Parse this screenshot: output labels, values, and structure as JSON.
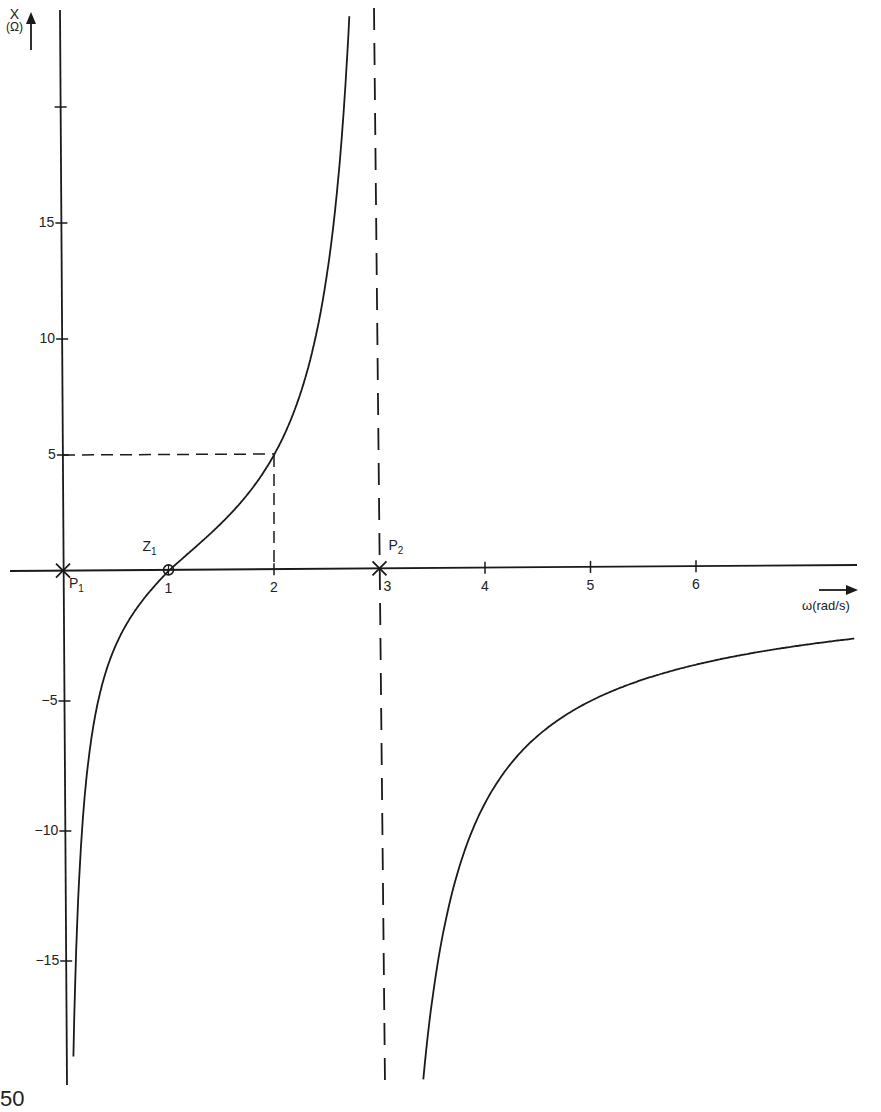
{
  "chart_data": {
    "type": "line",
    "title": "",
    "xlabel": "ω(rad/s)",
    "ylabel": "X",
    "ylabel_unit": "(Ω)",
    "x_ticks": [
      1,
      2,
      3,
      4,
      5,
      6
    ],
    "y_ticks": [
      -15,
      -10,
      -5,
      5,
      10,
      15,
      20
    ],
    "y_tick_labels": [
      "−15",
      "−10",
      "−5",
      "5",
      "10",
      "15",
      ""
    ],
    "xlim": [
      0,
      7.5
    ],
    "ylim": [
      -19,
      24
    ],
    "grid": false,
    "function": "X(ω) = -K(ω²-1) / (ω(ω²-9)), K ≈ 16.67",
    "K": 16.67,
    "series": [
      {
        "name": "branch-left",
        "x": [
          0.05,
          0.1,
          0.2,
          0.3,
          0.5,
          0.75,
          1.0,
          1.25,
          1.5,
          1.75,
          2.0,
          2.25,
          2.5,
          2.6,
          2.72
        ],
        "values": [
          -37.0,
          -18.4,
          -8.9,
          -5.7,
          -2.86,
          -1.0,
          0.0,
          0.88,
          1.85,
          3.1,
          5.0,
          8.1,
          14.3,
          19.1,
          24.5
        ]
      },
      {
        "name": "branch-right",
        "x": [
          3.32,
          3.4,
          3.5,
          3.75,
          4.0,
          4.5,
          5.0,
          5.5,
          6.0,
          6.5,
          7.0,
          7.5
        ],
        "values": [
          -19.0,
          -16.6,
          -13.9,
          -10.2,
          -8.9,
          -6.2,
          -5.0,
          -4.2,
          -3.6,
          -3.1,
          -2.8,
          -2.6
        ]
      }
    ],
    "annotations": {
      "poles": [
        {
          "label": "P",
          "sub": "1",
          "omega": 0
        },
        {
          "label": "P",
          "sub": "2",
          "omega": 3
        }
      ],
      "zeros": [
        {
          "label": "Z",
          "sub": "1",
          "omega": 1
        }
      ],
      "reference_point": {
        "omega": 2,
        "X": 5
      },
      "asymptote": {
        "omega": 3,
        "style": "dashed"
      }
    }
  },
  "page": {
    "number_fragment": "50"
  }
}
